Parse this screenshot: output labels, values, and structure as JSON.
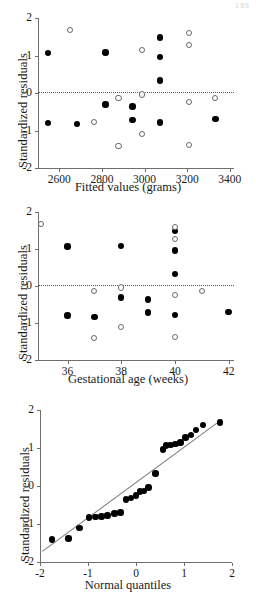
{
  "figure": {
    "corner_mark": "188",
    "background": "#ffffff",
    "point_filled_color": "#000000",
    "point_open_color": "#ffffff",
    "point_open_stroke": "#6a6a6a",
    "axis_color": "#6e6e6e",
    "reference_line_style": "dotted"
  },
  "chart_data": [
    {
      "id": "residuals-vs-fitted",
      "type": "scatter",
      "title": "",
      "xlabel": "Fitted values (grams)",
      "ylabel": "Standardized residuals",
      "xlim": [
        2500,
        3420
      ],
      "ylim": [
        -2,
        2
      ],
      "xticks": [
        2600,
        2800,
        3000,
        3200,
        3400
      ],
      "xticklabels": [
        "2600",
        "2800",
        "3000",
        "3200",
        "3400"
      ],
      "yticks": [
        -2,
        -1,
        0,
        1,
        2
      ],
      "yticklabels": [
        "-2",
        "-1",
        "0",
        "1",
        "2"
      ],
      "grid": false,
      "legend": "none",
      "reference_line": {
        "type": "horizontal",
        "y": 0.03
      },
      "series": [
        {
          "name": "filled",
          "marker": "filled-circle",
          "points": [
            [
              2548,
              1.07
            ],
            [
              2548,
              -0.8
            ],
            [
              2683,
              -0.83
            ],
            [
              2816,
              1.08
            ],
            [
              2816,
              -0.31
            ],
            [
              2943,
              -0.36
            ],
            [
              2943,
              -0.72
            ],
            [
              3073,
              1.48
            ],
            [
              3073,
              0.96
            ],
            [
              3073,
              0.33
            ],
            [
              3073,
              -0.79
            ],
            [
              3333,
              -0.7
            ]
          ]
        },
        {
          "name": "open",
          "marker": "open-circle",
          "points": [
            [
              2652,
              1.67
            ],
            [
              2762,
              -0.78
            ],
            [
              2878,
              -0.13
            ],
            [
              2878,
              -1.41
            ],
            [
              2988,
              1.14
            ],
            [
              2988,
              -0.04
            ],
            [
              2988,
              -1.1
            ],
            [
              3208,
              1.6
            ],
            [
              3208,
              1.28
            ],
            [
              3208,
              -0.25
            ],
            [
              3208,
              -1.38
            ],
            [
              3330,
              -0.14
            ]
          ]
        }
      ]
    },
    {
      "id": "residuals-vs-gestational-age",
      "type": "scatter",
      "title": "",
      "xlabel": "Gestational age (weeks)",
      "ylabel": "Standardized residuals",
      "xlim": [
        34.9,
        42.2
      ],
      "ylim": [
        -2,
        2
      ],
      "xticks": [
        36,
        38,
        40,
        42
      ],
      "xticklabels": [
        "36",
        "38",
        "40",
        "42"
      ],
      "yticks": [
        -2,
        -1,
        0,
        1,
        2
      ],
      "yticklabels": [
        "-2",
        "-1",
        "0",
        "1",
        "2"
      ],
      "grid": false,
      "legend": "none",
      "reference_line": {
        "type": "horizontal",
        "y": 0.03
      },
      "series": [
        {
          "name": "filled",
          "marker": "filled-circle",
          "points": [
            [
              36,
              1.07
            ],
            [
              36,
              -0.8
            ],
            [
              37,
              -0.83
            ],
            [
              38,
              1.08
            ],
            [
              38,
              -0.31
            ],
            [
              39,
              -0.36
            ],
            [
              39,
              -0.72
            ],
            [
              40,
              1.48
            ],
            [
              40,
              0.96
            ],
            [
              40,
              0.33
            ],
            [
              40,
              -0.79
            ],
            [
              42,
              -0.7
            ]
          ]
        },
        {
          "name": "open",
          "marker": "open-circle",
          "points": [
            [
              35,
              1.67
            ],
            [
              37,
              -0.13
            ],
            [
              37,
              -1.41
            ],
            [
              38,
              -0.04
            ],
            [
              38,
              -1.1
            ],
            [
              40,
              1.6
            ],
            [
              40,
              1.28
            ],
            [
              40,
              -0.25
            ],
            [
              40,
              -1.38
            ],
            [
              41,
              -0.14
            ]
          ]
        }
      ]
    },
    {
      "id": "normal-qq-plot",
      "type": "scatter",
      "title": "",
      "xlabel": "Normal quantiles",
      "ylabel": "Standardized residuals",
      "xlim": [
        -2,
        2
      ],
      "ylim": [
        -2,
        2
      ],
      "xticks": [
        -2,
        -1,
        0,
        1,
        2
      ],
      "xticklabels": [
        "-2",
        "-1",
        "0",
        "1",
        "2"
      ],
      "yticks": [
        -2,
        -1,
        0,
        1,
        2
      ],
      "yticklabels": [
        "-2",
        "-1",
        "0",
        "1",
        "2"
      ],
      "grid": false,
      "legend": "none",
      "reference_line": {
        "type": "diagonal",
        "x0": -1.95,
        "y0": -1.7,
        "x1": 1.8,
        "y1": 1.78
      },
      "series": [
        {
          "name": "filled",
          "marker": "filled-circle",
          "points": [
            [
              -1.75,
              -1.41
            ],
            [
              -1.41,
              -1.38
            ],
            [
              -1.18,
              -1.1
            ],
            [
              -0.98,
              -0.83
            ],
            [
              -0.84,
              -0.81
            ],
            [
              -0.72,
              -0.8
            ],
            [
              -0.59,
              -0.78
            ],
            [
              -0.45,
              -0.72
            ],
            [
              -0.32,
              -0.7
            ],
            [
              -0.21,
              -0.36
            ],
            [
              -0.11,
              -0.31
            ],
            [
              0.0,
              -0.25
            ],
            [
              0.08,
              -0.14
            ],
            [
              0.17,
              -0.13
            ],
            [
              0.26,
              -0.04
            ],
            [
              0.41,
              0.33
            ],
            [
              0.56,
              0.96
            ],
            [
              0.63,
              1.07
            ],
            [
              0.72,
              1.08
            ],
            [
              0.82,
              1.1
            ],
            [
              0.93,
              1.14
            ],
            [
              1.03,
              1.28
            ],
            [
              1.15,
              1.35
            ],
            [
              1.25,
              1.48
            ],
            [
              1.4,
              1.6
            ],
            [
              1.75,
              1.67
            ]
          ]
        }
      ]
    }
  ]
}
